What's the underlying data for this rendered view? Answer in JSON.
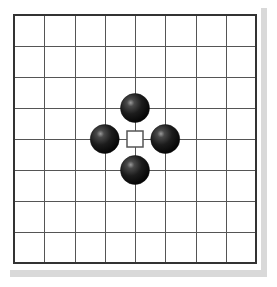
{
  "diagram": {
    "type": "go-board-diagram",
    "board": {
      "lines_x": 9,
      "lines_y": 9,
      "origin_x": 14,
      "origin_y": 15,
      "step_x": 30.25,
      "step_y": 31,
      "background": "#ffffff",
      "line_color": "#555555",
      "border_color": "#333333",
      "shadow_color": "#d9d9d9"
    },
    "stones": [
      {
        "color": "black",
        "col": 4,
        "row": 3
      },
      {
        "color": "black",
        "col": 3,
        "row": 4
      },
      {
        "color": "black",
        "col": 5,
        "row": 4
      },
      {
        "color": "black",
        "col": 4,
        "row": 5
      }
    ],
    "markers": [
      {
        "shape": "square",
        "col": 4,
        "row": 4,
        "size": 16,
        "stroke": "#555555",
        "fill": "#ffffff"
      }
    ],
    "stone_radius": 14.5
  }
}
